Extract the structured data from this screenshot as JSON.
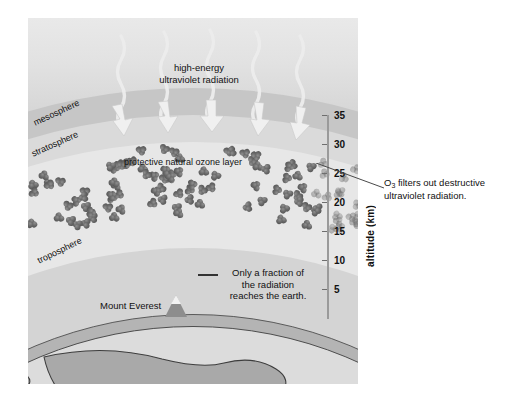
{
  "figure": {
    "title_uv": "high-energy\nultraviolet radiation",
    "uv_line1": "high-energy",
    "uv_line2": "ultraviolet radiation",
    "ozone_layer_label": "protective natural ozone layer",
    "everest_label": "Mount Everest",
    "fraction_note_line1": "Only a fraction of",
    "fraction_note_line2": "the radiation",
    "fraction_note_line3": "reaches the earth.",
    "layers": [
      {
        "name": "mesosphere",
        "label": "mesosphere"
      },
      {
        "name": "stratosphere",
        "label": "stratosphere"
      },
      {
        "name": "troposphere",
        "label": "troposphere"
      }
    ]
  },
  "axis": {
    "title": "altitude (km)",
    "ticks": [
      {
        "value": 35,
        "label": "35",
        "y": 0
      },
      {
        "value": 30,
        "label": "30",
        "y": 29
      },
      {
        "value": 25,
        "label": "25",
        "y": 58
      },
      {
        "value": 20,
        "label": "20",
        "y": 87
      },
      {
        "value": 15,
        "label": "15",
        "y": 116
      },
      {
        "value": 10,
        "label": "10",
        "y": 145
      },
      {
        "value": 5,
        "label": "5",
        "y": 174
      }
    ],
    "unit": "km",
    "min": 5,
    "max": 35
  },
  "callout": {
    "o3_prefix": "O",
    "o3_subscript": "3",
    "o3_text": " filters out destructive ultraviolet radiation.",
    "o3_full": "O3 filters out destructive ultraviolet radiation."
  },
  "colors": {
    "molecule": "#5d5d5d",
    "sky": "#dcdcdc",
    "mesosphere_band": "#c6c6c6",
    "ozone_band": "#e7e7e7",
    "earth_land": "#a9a9a9",
    "earth_sea": "#dcdcdc",
    "axis_line": "#9a9a9a",
    "text": "#111111"
  },
  "chart_data": {
    "type": "diagram",
    "ylabel": "altitude (km)",
    "ylim": [
      0,
      37
    ],
    "yticks": [
      5,
      10,
      15,
      20,
      25,
      30,
      35
    ],
    "annotations": [
      "high-energy ultraviolet radiation",
      "protective natural ozone layer",
      "Only a fraction of the radiation reaches the earth.",
      "O3 filters out destructive ultraviolet radiation."
    ],
    "regions": [
      {
        "name": "mesosphere",
        "approx_altitude_km": [
          32,
          37
        ]
      },
      {
        "name": "stratosphere",
        "approx_altitude_km": [
          14,
          32
        ]
      },
      {
        "name": "troposphere",
        "approx_altitude_km": [
          0,
          14
        ]
      }
    ],
    "ozone_layer_altitude_km": [
      20,
      31
    ],
    "mount_everest_altitude_km": 8.8
  }
}
